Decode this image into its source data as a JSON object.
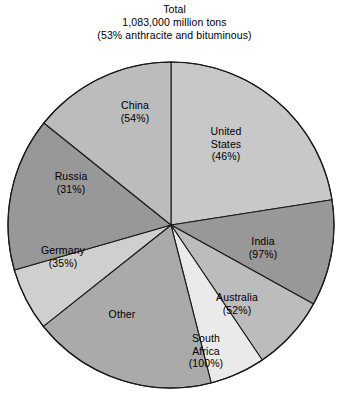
{
  "title": {
    "line1": "Total",
    "line2": "1,083,000 million tons",
    "line3": "(53% anthracite and bituminous)"
  },
  "chart_data": {
    "type": "pie",
    "title": "Total 1,083,000 million tons (53% anthracite and bituminous)",
    "total_label": "Total",
    "total_value": "1,083,000 million tons",
    "note": "(53% anthracite and bituminous)",
    "unit": "million tons",
    "value_type": "angular share of pie (percent of total recoverable coal reserves)",
    "legend": "none (labels drawn inside slices)",
    "grid": false,
    "start_angle_deg": 0,
    "direction": "clockwise",
    "labels_show_percent_anthracite_bituminous": true,
    "categories": [
      "United States",
      "India",
      "Australia",
      "South Africa",
      "Other",
      "Germany",
      "Russia",
      "China"
    ],
    "values": [
      25.0,
      11.7,
      8.3,
      6.1,
      20.3,
      6.9,
      16.9,
      15.8
    ],
    "slices": [
      {
        "name": "United States",
        "label": "United States",
        "label_lines": [
          "United",
          "States"
        ],
        "percent_label": "(46%)",
        "percent_value": 46,
        "share_of_pie": 25.0,
        "angle_deg": 90,
        "start_deg": 0,
        "end_deg": 90,
        "color": "#c8c8c8"
      },
      {
        "name": "India",
        "label": "India",
        "label_lines": [
          "India"
        ],
        "percent_label": "(97%)",
        "percent_value": 97,
        "share_of_pie": 11.7,
        "angle_deg": 42,
        "start_deg": 90,
        "end_deg": 132,
        "color": "#989898"
      },
      {
        "name": "Australia",
        "label": "Australia",
        "label_lines": [
          "Australia"
        ],
        "percent_label": "(52%)",
        "percent_value": 52,
        "share_of_pie": 8.3,
        "angle_deg": 30,
        "start_deg": 132,
        "end_deg": 162,
        "color": "#bcbcbc"
      },
      {
        "name": "South Africa",
        "label": "South Africa",
        "label_lines": [
          "South",
          "Africa"
        ],
        "percent_label": "(100%)",
        "percent_value": 100,
        "share_of_pie": 6.1,
        "angle_deg": 22,
        "start_deg": 162,
        "end_deg": 184,
        "color": "#eaeaea"
      },
      {
        "name": "Other",
        "label": "Other",
        "label_lines": [
          "Other"
        ],
        "percent_label": "",
        "percent_value": null,
        "share_of_pie": 20.3,
        "angle_deg": 73,
        "start_deg": 184,
        "end_deg": 257,
        "color": "#aaaaaa"
      },
      {
        "name": "Germany",
        "label": "Germany",
        "label_lines": [
          "Germany"
        ],
        "percent_label": "(35%)",
        "percent_value": 35,
        "share_of_pie": 6.9,
        "angle_deg": 25,
        "start_deg": 257,
        "end_deg": 282,
        "color": "#cfcfcf"
      },
      {
        "name": "Russia",
        "label": "Russia",
        "label_lines": [
          "Russia"
        ],
        "percent_label": "(31%)",
        "percent_value": 31,
        "share_of_pie": 16.9,
        "angle_deg": 61,
        "start_deg": 282,
        "end_deg": 343,
        "color": "#989898"
      },
      {
        "name": "China",
        "label": "China",
        "label_lines": [
          "China"
        ],
        "percent_label": "(54%)",
        "percent_value": 54,
        "share_of_pie": 15.8,
        "angle_deg": 57,
        "start_deg": 303,
        "end_deg": 360,
        "color": "#bcbcbc"
      }
    ]
  },
  "labels": {
    "us_name": "United",
    "us_name2": "States",
    "us_pct": "(46%)",
    "india_name": "India",
    "india_pct": "(97%)",
    "australia_name": "Australia",
    "australia_pct": "(52%)",
    "safrica_name": "South",
    "safrica_name2": "Africa",
    "safrica_pct": "(100%)",
    "other_name": "Other",
    "germany_name": "Germany",
    "germany_pct": "(35%)",
    "russia_name": "Russia",
    "russia_pct": "(31%)",
    "china_name": "China",
    "china_pct": "(54%)"
  }
}
